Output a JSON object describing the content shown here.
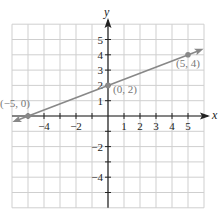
{
  "chart_data": {
    "type": "line",
    "title": "",
    "xlabel": "x",
    "ylabel": "y",
    "xlim": [
      -6,
      6
    ],
    "ylim": [
      -6,
      6
    ],
    "grid": true,
    "x_tick_labels": [
      {
        "value": -4,
        "label": "−4"
      },
      {
        "value": -2,
        "label": "−2"
      },
      {
        "value": 1,
        "label": "1"
      },
      {
        "value": 2,
        "label": "2"
      },
      {
        "value": 3,
        "label": "3"
      },
      {
        "value": 4,
        "label": "4"
      },
      {
        "value": 5,
        "label": "5"
      }
    ],
    "y_tick_labels": [
      {
        "value": 5,
        "label": "5"
      },
      {
        "value": 4,
        "label": "4"
      },
      {
        "value": 3,
        "label": "3"
      },
      {
        "value": 2,
        "label": "2"
      },
      {
        "value": 1,
        "label": "1"
      },
      {
        "value": -2,
        "label": "−2"
      },
      {
        "value": -4,
        "label": "−4"
      }
    ],
    "series": [
      {
        "name": "line",
        "equation": "y = 0.4x + 2",
        "slope": 0.4,
        "intercept": 2,
        "color": "#888888",
        "arrows": "both",
        "x_range": [
          -5.8,
          5.8
        ],
        "points": [
          {
            "x": -5,
            "y": 0,
            "label": "(−5, 0)"
          },
          {
            "x": 0,
            "y": 2,
            "label": "(0, 2)"
          },
          {
            "x": 5,
            "y": 4,
            "label": "(5, 4)"
          }
        ]
      }
    ],
    "colors": {
      "grid": "#cfcfcf",
      "axis": "#222222",
      "line": "#888888",
      "point_label": "#777777"
    }
  }
}
